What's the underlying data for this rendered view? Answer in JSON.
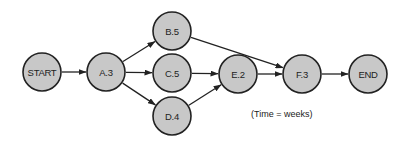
{
  "diagram": {
    "type": "network",
    "note": "(Time = weeks)",
    "colors": {
      "node_fill": "#c8c8c8",
      "stroke": "#222222"
    },
    "nodes": [
      {
        "id": "START",
        "label": "START",
        "x": 42,
        "y": 72
      },
      {
        "id": "A",
        "label": "A.3",
        "x": 106,
        "y": 72
      },
      {
        "id": "B",
        "label": "B.5",
        "x": 172,
        "y": 31
      },
      {
        "id": "C",
        "label": "C.5",
        "x": 172,
        "y": 73
      },
      {
        "id": "D",
        "label": "D.4",
        "x": 172,
        "y": 116
      },
      {
        "id": "E",
        "label": "E.2",
        "x": 238,
        "y": 74
      },
      {
        "id": "F",
        "label": "F.3",
        "x": 302,
        "y": 74
      },
      {
        "id": "END",
        "label": "END",
        "x": 368,
        "y": 74
      }
    ],
    "edges": [
      {
        "from": "START",
        "to": "A"
      },
      {
        "from": "A",
        "to": "B"
      },
      {
        "from": "A",
        "to": "C"
      },
      {
        "from": "A",
        "to": "D"
      },
      {
        "from": "B",
        "to": "F"
      },
      {
        "from": "C",
        "to": "E"
      },
      {
        "from": "D",
        "to": "E"
      },
      {
        "from": "E",
        "to": "F"
      },
      {
        "from": "F",
        "to": "END"
      }
    ]
  }
}
